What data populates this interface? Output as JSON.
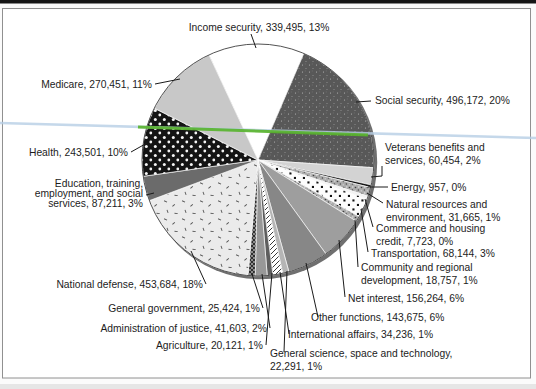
{
  "figure": {
    "background": "#fbfbfb",
    "frame_color": "#909090",
    "top_bar_color": "#161616",
    "bottom_strip_color": "#e6e6e6",
    "scan_artifacts": {
      "blue_line": {
        "from": [
          0,
          123
        ],
        "to": [
          536,
          138
        ],
        "color": "#b7cfe6",
        "width": 2.6,
        "opacity": 0.8
      },
      "green_line": {
        "from": [
          138,
          127
        ],
        "to": [
          368,
          135
        ],
        "color": "#58b42c",
        "width": 3,
        "opacity": 0.9
      }
    }
  },
  "chart_data": {
    "type": "pie",
    "title": "",
    "legend": "none",
    "labels_style": "callout-lines",
    "center": [
      258,
      160
    ],
    "radius": 116,
    "start_angle_deg": -25,
    "min_slice_angle_deg": 1.3,
    "shadow_color": "#6f6f6f",
    "outline_color": "#3f3f3f",
    "leader_color": "#1a1a1a",
    "slices": [
      {
        "name": "income-security",
        "value": 339495,
        "pct": "13%",
        "label_lines": [
          "Income security, 339,495, 13%"
        ],
        "align": "middle",
        "label_x": 259,
        "label_ys": [
          31
        ],
        "leader": [
          [
            251,
            34
          ],
          [
            256,
            48
          ]
        ],
        "fill": "solid",
        "color": "#ffffff"
      },
      {
        "name": "social-security",
        "value": 496172,
        "pct": "20%",
        "label_lines": [
          "Social security, 496,172, 20%"
        ],
        "align": "start",
        "label_x": 375,
        "label_ys": [
          104
        ],
        "leader": [
          [
            371,
            101
          ],
          [
            356,
            102
          ]
        ],
        "fill": "speckle-dark",
        "color": "#585858"
      },
      {
        "name": "veterans-benefits",
        "value": 60454,
        "pct": "2%",
        "label_lines": [
          "Veterans benefits and",
          "services, 60,454, 2%"
        ],
        "align": "start",
        "label_x": 385,
        "label_ys": [
          151,
          164
        ],
        "leader": [
          [
            382,
            166
          ],
          [
            382,
            176
          ],
          [
            371,
            177
          ]
        ],
        "fill": "solid",
        "color": "#d3d3d3"
      },
      {
        "name": "energy",
        "value": 957,
        "pct": "0%",
        "label_lines": [
          "Energy, 957, 0%"
        ],
        "align": "start",
        "label_x": 391,
        "label_ys": [
          191
        ],
        "leader": [
          [
            388,
            187
          ],
          [
            368,
            187
          ]
        ],
        "fill": "solid",
        "color": "#161616"
      },
      {
        "name": "natural-resources",
        "value": 31665,
        "pct": "1%",
        "label_lines": [
          "Natural resources and",
          "environment, 31,665, 1%"
        ],
        "align": "start",
        "label_x": 386,
        "label_ys": [
          208,
          221
        ],
        "leader": [
          [
            383,
            203
          ],
          [
            367,
            193
          ]
        ],
        "fill": "stipple",
        "color": "#ababab"
      },
      {
        "name": "commerce-housing-credit",
        "value": 7723,
        "pct": "0%",
        "label_lines": [
          "Commerce and housing",
          "credit, 7,723, 0%"
        ],
        "align": "start",
        "label_x": 376,
        "label_ys": [
          232,
          245
        ],
        "leader": [
          [
            373,
            227
          ],
          [
            365,
            199
          ]
        ],
        "fill": "solid",
        "color": "#f2f2f2"
      },
      {
        "name": "transportation",
        "value": 68144,
        "pct": "3%",
        "label_lines": [
          "Transportation, 68,144, 3%"
        ],
        "align": "start",
        "label_x": 371,
        "label_ys": [
          257
        ],
        "leader": [
          [
            368,
            252
          ],
          [
            361,
            209
          ]
        ],
        "fill": "polka-black",
        "color": "#fdfdfd"
      },
      {
        "name": "community-regional-development",
        "value": 18757,
        "pct": "1%",
        "label_lines": [
          "Community and regional",
          "development, 18,757, 1%"
        ],
        "align": "start",
        "label_x": 361,
        "label_ys": [
          271,
          284
        ],
        "leader": [
          [
            358,
            267
          ],
          [
            355,
            220
          ]
        ],
        "fill": "stipple",
        "color": "#ababab"
      },
      {
        "name": "net-interest",
        "value": 156264,
        "pct": "6%",
        "label_lines": [
          "Net interest, 156,264, 6%"
        ],
        "align": "start",
        "label_x": 348,
        "label_ys": [
          302
        ],
        "leader": [
          [
            345,
            297
          ],
          [
            339,
            240
          ]
        ],
        "fill": "solid",
        "color": "#9e9e9e"
      },
      {
        "name": "other-functions",
        "value": 143675,
        "pct": "6%",
        "label_lines": [
          "Other functions, 143,675, 6%"
        ],
        "align": "start",
        "label_x": 311,
        "label_ys": [
          321
        ],
        "leader": [
          [
            318,
            317
          ],
          [
            306,
            263
          ]
        ],
        "fill": "solid",
        "color": "#878787"
      },
      {
        "name": "general-science-space-technology",
        "value": 22291,
        "pct": "1%",
        "label_lines": [
          "General science, space and technology,",
          "22,291, 1%"
        ],
        "align": "start",
        "label_x": 270,
        "label_ys": [
          357,
          370
        ],
        "leader": [
          [
            284,
            352
          ],
          [
            287,
            271
          ]
        ],
        "fill": "solid",
        "color": "#b5b5b5"
      },
      {
        "name": "international-affairs",
        "value": 34236,
        "pct": "1%",
        "label_lines": [
          "International affairs, 34,236, 1%"
        ],
        "align": "start",
        "label_x": 288,
        "label_ys": [
          338
        ],
        "leader": [
          [
            289,
            334
          ],
          [
            280,
            272
          ]
        ],
        "fill": "diag",
        "color": "#ffffff"
      },
      {
        "name": "agriculture",
        "value": 20121,
        "pct": "1%",
        "label_lines": [
          "Agriculture, 20,121, 1%"
        ],
        "align": "end",
        "label_x": 263,
        "label_ys": [
          349
        ],
        "leader": [
          [
            266,
            345
          ],
          [
            272,
            273
          ]
        ],
        "fill": "solid",
        "color": "#5e5e5e"
      },
      {
        "name": "administration-of-justice",
        "value": 41603,
        "pct": "2%",
        "label_lines": [
          "Administration of justice, 41,603, 2%"
        ],
        "align": "end",
        "label_x": 267,
        "label_ys": [
          332
        ],
        "leader": [
          [
            270,
            328
          ],
          [
            262,
            274
          ]
        ],
        "fill": "solid",
        "color": "#989898"
      },
      {
        "name": "general-government",
        "value": 25424,
        "pct": "1%",
        "label_lines": [
          "General government, 25,424, 1%"
        ],
        "align": "end",
        "label_x": 260,
        "label_ys": [
          312
        ],
        "leader": [
          [
            263,
            308
          ],
          [
            252,
            274
          ]
        ],
        "fill": "checker",
        "color": "#2e2e2e"
      },
      {
        "name": "national-defense",
        "value": 453684,
        "pct": "18%",
        "label_lines": [
          "National defense, 453,684, 18%"
        ],
        "align": "end",
        "label_x": 203,
        "label_ys": [
          288
        ],
        "leader": [
          [
            206,
            284
          ],
          [
            191,
            251
          ]
        ],
        "fill": "rice",
        "color": "#ebebeb"
      },
      {
        "name": "education-training-employment-social-services",
        "value": 87211,
        "pct": "3%",
        "label_lines": [
          "Education, training,",
          "employment, and social",
          "services, 87,211, 3%"
        ],
        "align": "end",
        "label_x": 143,
        "label_ys": [
          187,
          197,
          207
        ],
        "leader": [
          [
            146,
            195
          ],
          [
            154,
            193
          ]
        ],
        "fill": "solid",
        "color": "#6b6b6b"
      },
      {
        "name": "health",
        "value": 243501,
        "pct": "10%",
        "label_lines": [
          "Health, 243,501, 10%"
        ],
        "align": "end",
        "label_x": 128,
        "label_ys": [
          156
        ],
        "leader": [
          [
            131,
            152
          ],
          [
            147,
            143
          ]
        ],
        "fill": "dots-on-black",
        "color": "#141414"
      },
      {
        "name": "medicare",
        "value": 270451,
        "pct": "11%",
        "label_lines": [
          "Medicare, 270,451, 11%"
        ],
        "align": "end",
        "label_x": 152,
        "label_ys": [
          88
        ],
        "leader": [
          [
            155,
            84
          ],
          [
            180,
            79
          ]
        ],
        "fill": "solid",
        "color": "#c8c8c8"
      }
    ]
  }
}
